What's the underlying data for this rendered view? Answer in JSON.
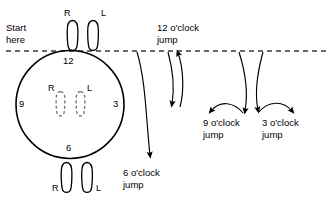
{
  "figure": {
    "title_visible": false,
    "background": "#ffffff",
    "stroke": "#000000"
  },
  "start": {
    "line1": "Start",
    "line2": "here"
  },
  "clock": {
    "top": "12",
    "right": "3",
    "bottom": "6",
    "left": "9"
  },
  "feet": {
    "start_right_label": "R",
    "start_left_label": "L",
    "inside_right_label": "R",
    "inside_left_label": "L",
    "bottom_right_label": "R",
    "bottom_left_label": "L"
  },
  "jumps": [
    {
      "name": "twelve",
      "line1": "12 o'clock",
      "line2": "jump"
    },
    {
      "name": "six",
      "line1": "6 o'clock",
      "line2": "jump"
    },
    {
      "name": "nine",
      "line1": "9 o'clock",
      "line2": "jump"
    },
    {
      "name": "three",
      "line1": "3 o'clock",
      "line2": "jump"
    }
  ],
  "dashed_line": {
    "description": "horizontal reference line",
    "dash": "5 4"
  }
}
